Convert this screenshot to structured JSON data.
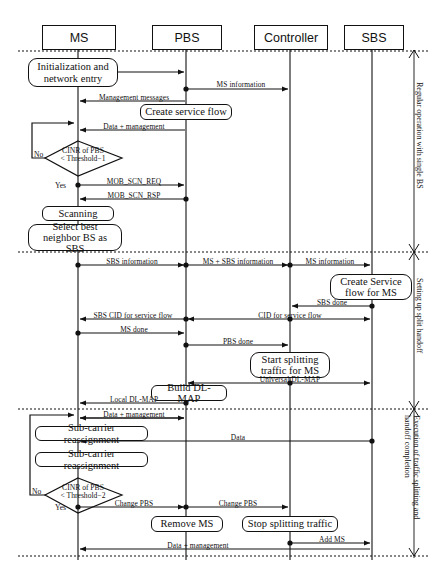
{
  "actors": [
    {
      "id": "ms",
      "label": "MS",
      "x": 78
    },
    {
      "id": "pbs",
      "label": "PBS",
      "x": 186
    },
    {
      "id": "controller",
      "label": "Controller",
      "x": 290
    },
    {
      "id": "sbs",
      "label": "SBS",
      "x": 372
    }
  ],
  "phases": [
    {
      "id": "phase-regular",
      "label": "Regular operation with single BS",
      "lines": [
        "Regular operation with single BS"
      ]
    },
    {
      "id": "phase-setup",
      "label": "Setting up split handoff",
      "lines": [
        "Setting up split handoff"
      ]
    },
    {
      "id": "phase-execution",
      "label": "Execution of traffic splitting and handoff completion",
      "lines": [
        "Execution of traffic splitting and",
        "handoff completion"
      ]
    }
  ],
  "activities": [
    {
      "id": "act-init",
      "lines": [
        "Initialization and",
        "network entry"
      ]
    },
    {
      "id": "act-create-service-flow",
      "lines": [
        "Create service flow"
      ]
    },
    {
      "id": "act-scanning",
      "lines": [
        "Scanning"
      ]
    },
    {
      "id": "act-select-best-neighbor",
      "lines": [
        "Select best",
        "neighbor BS as SBS"
      ]
    },
    {
      "id": "act-create-service-flow-ms",
      "lines": [
        "Create Service",
        "flow for MS"
      ]
    },
    {
      "id": "act-start-splitting",
      "lines": [
        "Start splitting",
        "traffic for MS"
      ]
    },
    {
      "id": "act-build-dl-map",
      "lines": [
        "Build DL-MAP"
      ]
    },
    {
      "id": "act-subcarrier-1",
      "lines": [
        "Sub-carrier reassignment"
      ]
    },
    {
      "id": "act-subcarrier-2",
      "lines": [
        "Sub-carrier reassignment"
      ]
    },
    {
      "id": "act-remove-ms",
      "lines": [
        "Remove MS"
      ]
    },
    {
      "id": "act-stop-splitting",
      "lines": [
        "Stop splitting traffic"
      ]
    }
  ],
  "decisions": [
    {
      "id": "decision-threshold-1",
      "lines": [
        "CINR of PBS",
        "< Threshold−1"
      ],
      "yes": "Yes",
      "no": "No"
    },
    {
      "id": "decision-threshold-2",
      "lines": [
        "CINR of PBS",
        "< Threshold−2"
      ],
      "yes": "Yes",
      "no": "No"
    }
  ],
  "messages": [
    {
      "id": "msg-ms-information-1",
      "label": "MS information"
    },
    {
      "id": "msg-management-messages",
      "label": "Management messages"
    },
    {
      "id": "msg-data-management-1",
      "label": "Data + management"
    },
    {
      "id": "msg-mob-scn-req",
      "label": "MOB_SCN_REQ"
    },
    {
      "id": "msg-mob-scn-rsp",
      "label": "MOB_SCN_RSP"
    },
    {
      "id": "msg-sbs-information",
      "label": "SBS information"
    },
    {
      "id": "msg-ms-sbs-information",
      "label": "MS + SBS information"
    },
    {
      "id": "msg-ms-information-2",
      "label": "MS information"
    },
    {
      "id": "msg-sbs-done",
      "label": "SBS done"
    },
    {
      "id": "msg-cid-service-flow",
      "label": "CID for service flow"
    },
    {
      "id": "msg-sbs-cid-service-flow",
      "label": "SBS CID for service flow"
    },
    {
      "id": "msg-ms-done",
      "label": "MS done"
    },
    {
      "id": "msg-pbs-done",
      "label": "PBS done"
    },
    {
      "id": "msg-universal-dl-map",
      "label": "Universal DL-MAP"
    },
    {
      "id": "msg-local-dl-map",
      "label": "Local DL-MAP"
    },
    {
      "id": "msg-data-management-2",
      "label": "Data + management"
    },
    {
      "id": "msg-data",
      "label": "Data"
    },
    {
      "id": "msg-change-pbs-1",
      "label": "Change PBS"
    },
    {
      "id": "msg-change-pbs-2",
      "label": "Change PBS"
    },
    {
      "id": "msg-add-ms",
      "label": "Add MS"
    },
    {
      "id": "msg-data-management-3",
      "label": "Data + management"
    }
  ],
  "colors": {
    "line": "#111111",
    "background": "#ffffff"
  }
}
